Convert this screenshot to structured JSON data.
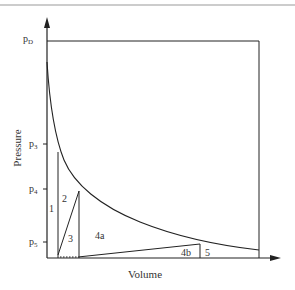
{
  "diagram": {
    "type": "pressure-volume diagram",
    "axes": {
      "x_label": "Volume",
      "y_label": "Pressure"
    },
    "pressure_ticks": [
      {
        "base": "p",
        "sub": "D"
      },
      {
        "base": "p",
        "sub": "3"
      },
      {
        "base": "p",
        "sub": "4"
      },
      {
        "base": "p",
        "sub": "5"
      }
    ],
    "regions": [
      "1",
      "2",
      "3",
      "4a",
      "4b",
      "5"
    ],
    "colors": {
      "line": "#222222",
      "top_rule": "#999999",
      "text": "#333333"
    }
  }
}
